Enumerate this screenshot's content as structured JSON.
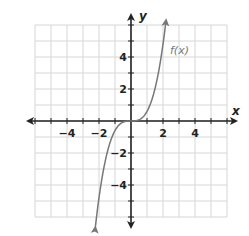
{
  "chart_data": {
    "type": "line",
    "title": "",
    "xlabel": "x",
    "ylabel": "y",
    "xlim": [
      -6,
      6
    ],
    "ylim": [
      -6,
      6
    ],
    "grid": true,
    "x_ticks": [
      -4,
      -2,
      2,
      4
    ],
    "y_ticks": [
      4,
      2,
      -2,
      -4
    ],
    "x_tick_labels": [
      "−4",
      "−2",
      "2",
      "4"
    ],
    "y_tick_labels": [
      "4",
      "2",
      "−2",
      "−4"
    ],
    "series": [
      {
        "name": "f(x)",
        "label": "f(x)",
        "color": "#777777",
        "function": "approximately 0.6x^3 (cubic through origin)",
        "x": [
          -2.2,
          -2,
          -1.5,
          -1,
          -0.5,
          0,
          0.5,
          1,
          1.5,
          2,
          2.2
        ],
        "y": [
          -6.4,
          -4.8,
          -2.0,
          -0.6,
          -0.08,
          0,
          0.08,
          0.6,
          2.0,
          4.8,
          6.0
        ],
        "arrows": "both ends"
      }
    ],
    "annotations": [
      {
        "text": "f(x)",
        "x": 2.5,
        "y": 4.5
      }
    ]
  },
  "labels": {
    "x_axis": "x",
    "y_axis": "y",
    "function": "f(x)",
    "xt_m4": "−4",
    "xt_m2": "−2",
    "xt_2": "2",
    "xt_4": "4",
    "yt_4": "4",
    "yt_2": "2",
    "yt_m2": "−2",
    "yt_m4": "−4"
  }
}
